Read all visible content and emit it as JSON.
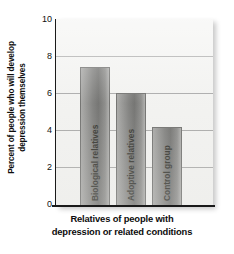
{
  "chart_data": {
    "type": "bar",
    "title": "",
    "subtitle": "",
    "categories": [
      "Biological relatives",
      "Adoptive relatives",
      "Control group"
    ],
    "values": [
      7.45,
      6.05,
      4.2
    ],
    "xlabel_line1": "Relatives of people with",
    "xlabel_line2": "depression or related conditions",
    "ylabel_line1": "Percent of people who will develop",
    "ylabel_line2": "depression themselves",
    "ylim": [
      0,
      10
    ],
    "yticks": [
      "0",
      "2",
      "4",
      "6",
      "8",
      "10"
    ],
    "ytick_values": [
      0,
      2,
      4,
      6,
      8,
      10
    ],
    "grid": "horizontal",
    "legend": "none",
    "bar_color": "#6f6f6d",
    "plot_background": "#f1f1ef",
    "gridline_color": "#8f8f8f",
    "axis_color": "#1a1a1a",
    "label_orientation": "vertical-inside-bars"
  }
}
